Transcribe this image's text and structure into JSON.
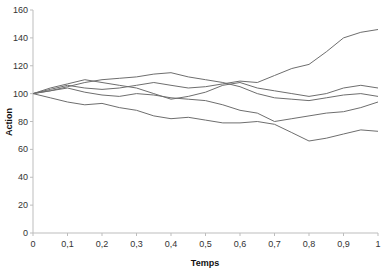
{
  "chart_data": {
    "type": "line",
    "title": "",
    "xlabel": "Temps",
    "ylabel": "Action",
    "xlim": [
      0,
      1
    ],
    "ylim": [
      0,
      160
    ],
    "grid": false,
    "legend": null,
    "x_ticks": [
      "0",
      "0,1",
      "0,2",
      "0,3",
      "0,4",
      "0,5",
      "0,6",
      "0,7",
      "0,8",
      "0,9",
      "1"
    ],
    "y_ticks": [
      "0",
      "20",
      "40",
      "60",
      "80",
      "100",
      "120",
      "140",
      "160"
    ],
    "x": [
      0,
      0.05,
      0.1,
      0.15,
      0.2,
      0.25,
      0.3,
      0.35,
      0.4,
      0.45,
      0.5,
      0.55,
      0.6,
      0.65,
      0.7,
      0.75,
      0.8,
      0.85,
      0.9,
      0.95,
      1.0
    ],
    "series": [
      {
        "name": "Trajectoire 1",
        "values": [
          100,
          103,
          106,
          104,
          103,
          104,
          106,
          108,
          106,
          104,
          105,
          107,
          109,
          108,
          113,
          118,
          121,
          130,
          140,
          144,
          146
        ]
      },
      {
        "name": "Trajectoire 2",
        "values": [
          100,
          102,
          105,
          108,
          110,
          111,
          112,
          114,
          115,
          112,
          110,
          108,
          105,
          100,
          97,
          96,
          95,
          97,
          99,
          100,
          98
        ]
      },
      {
        "name": "Trajectoire 3",
        "values": [
          100,
          104,
          107,
          110,
          108,
          106,
          104,
          100,
          96,
          98,
          101,
          106,
          108,
          104,
          102,
          100,
          98,
          100,
          104,
          106,
          104
        ]
      },
      {
        "name": "Trajectoire 4",
        "values": [
          100,
          102,
          104,
          101,
          99,
          98,
          100,
          99,
          97,
          96,
          95,
          92,
          88,
          86,
          80,
          82,
          84,
          86,
          87,
          90,
          94
        ]
      },
      {
        "name": "Trajectoire 5",
        "values": [
          100,
          97,
          94,
          92,
          93,
          90,
          88,
          84,
          82,
          83,
          81,
          79,
          79,
          80,
          78,
          72,
          66,
          68,
          71,
          74,
          73
        ]
      }
    ],
    "line_color": "#6e6e6e"
  }
}
